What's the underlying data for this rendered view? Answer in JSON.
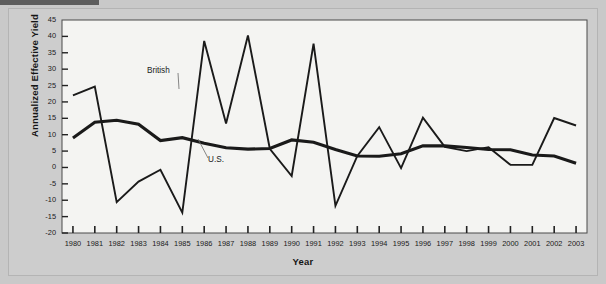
{
  "figure": {
    "plot_bg": "#f4f4f2",
    "frame_bg": "#cdcdcd",
    "line_color": "#1a1a1a"
  },
  "chart_data": {
    "type": "line",
    "title": "",
    "xlabel": "Year",
    "ylabel": "Annualized Effective Yield",
    "x": [
      1980,
      1981,
      1982,
      1983,
      1984,
      1985,
      1986,
      1987,
      1988,
      1989,
      1990,
      1991,
      1992,
      1993,
      1994,
      1995,
      1996,
      1997,
      1998,
      1999,
      2000,
      2001,
      2002,
      2003
    ],
    "xtick_labels": [
      "1980",
      "1981",
      "1982",
      "1983",
      "1984",
      "1985",
      "1986",
      "1987",
      "1988",
      "1989",
      "1990",
      "1991",
      "1992",
      "1993",
      "1994",
      "1995",
      "1996",
      "1997",
      "1998",
      "1999",
      "2000",
      "2001",
      "2002",
      "2003"
    ],
    "ytick_labels": [
      "45",
      "40",
      "35",
      "30",
      "25",
      "20",
      "15",
      "10",
      "5",
      "0",
      "-5",
      "-10",
      "-15",
      "-20"
    ],
    "ylim": [
      -20,
      45
    ],
    "ytick_step": 5,
    "grid": false,
    "legend_position": "inline-annotations",
    "series": [
      {
        "name": "British",
        "style": "thin",
        "values": [
          22.0,
          24.7,
          -10.6,
          -4.3,
          -0.7,
          -13.8,
          38.6,
          13.4,
          40.3,
          5.7,
          -2.6,
          37.8,
          -11.7,
          3.5,
          12.3,
          -0.2,
          15.2,
          6.3,
          5.0,
          6.2,
          0.8,
          0.8,
          15.1,
          12.8
        ]
      },
      {
        "name": "U.S.",
        "style": "thick",
        "values": [
          9.0,
          13.8,
          14.4,
          13.2,
          8.2,
          9.1,
          7.4,
          6.0,
          5.6,
          5.8,
          8.4,
          7.7,
          5.5,
          3.5,
          3.4,
          4.2,
          6.6,
          6.6,
          6.1,
          5.5,
          5.4,
          3.8,
          3.5,
          1.3
        ]
      }
    ],
    "annotations": [
      {
        "text": "British",
        "x_px": 147,
        "y_px": 66,
        "leader_to_x_px": 179,
        "leader_to_y_px": 89
      },
      {
        "text": "U.S.",
        "x_px": 208,
        "y_px": 155,
        "leader_to_x_px": 198,
        "leader_to_y_px": 139
      }
    ]
  }
}
